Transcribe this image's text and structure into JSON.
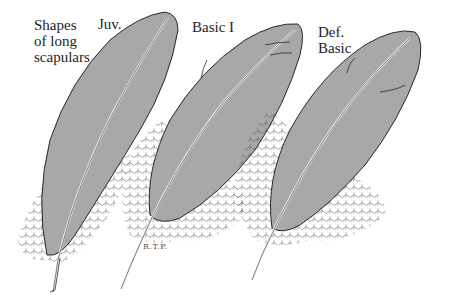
{
  "figure": {
    "title_lines": [
      "Shapes",
      "of long",
      "scapulars"
    ],
    "feathers": [
      {
        "label": "Juv."
      },
      {
        "label": "Basic I"
      },
      {
        "label_lines": [
          "Def.",
          "Basic"
        ]
      }
    ],
    "signature": "R.T.P.",
    "colors": {
      "vane_fill": "#a8a8a8",
      "outline": "#2a2a2a",
      "background": "#ffffff"
    }
  }
}
